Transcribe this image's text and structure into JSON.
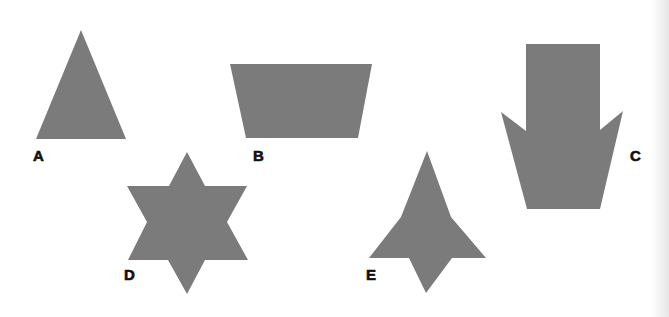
{
  "figure": {
    "fill_color": "#7b7b7b",
    "background": "#ffffff",
    "shapes": [
      {
        "id": "A",
        "label": "A",
        "kind": "triangle",
        "points": "81,30 126,139 36,139",
        "label_pos": {
          "x": 33,
          "y": 148
        }
      },
      {
        "id": "B",
        "label": "B",
        "kind": "trapezoid",
        "points": "230,64 372,64 358,138 246,138",
        "label_pos": {
          "x": 253,
          "y": 148
        }
      },
      {
        "id": "C",
        "label": "C",
        "kind": "arrow-like heptagon",
        "points": "526,44 600,44 600,130 623,111 600,209 527,209 501,112 526,131",
        "label_pos": {
          "x": 630,
          "y": 148
        }
      },
      {
        "id": "D",
        "label": "D",
        "kind": "six-pointed star",
        "points": "187,152 205,186 247,186 227,222 248,260 205,260 187,294 168,260 128,260 147,222 127,186 169,186",
        "label_pos": {
          "x": 124,
          "y": 267
        }
      },
      {
        "id": "E",
        "label": "E",
        "kind": "concave arrowhead",
        "points": "427,151 451,217 486,258 452,258 426,293 409,258 369,258 401,217",
        "label_pos": {
          "x": 366,
          "y": 267
        }
      }
    ]
  }
}
